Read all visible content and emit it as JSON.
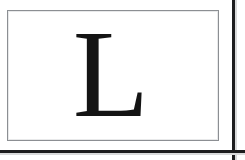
{
  "page": {
    "width": 245,
    "height": 160,
    "background_color": "#ffffff"
  },
  "document_plate": {
    "name": "framed-letter-plate",
    "background_color": "#ffffff",
    "border_color": "#8c8f93",
    "inner_hairline_color": "#e8e9ea"
  },
  "glyph": {
    "character": "L",
    "description": "capital letter L, serif typeface",
    "color": "#141414",
    "style": "serif",
    "case": "uppercase"
  },
  "edges": {
    "right_rule_color": "#1c1c1e",
    "bottom_rule_color": "#1c1c1e",
    "bleed_color": "#d9dadb"
  }
}
